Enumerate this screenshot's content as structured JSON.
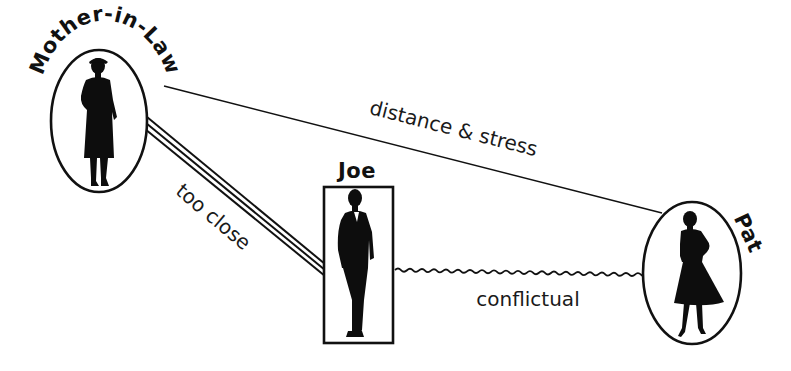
{
  "diagram": {
    "type": "relationship-diagram",
    "colors": {
      "ink": "#111111",
      "background": "#ffffff"
    },
    "nodes": {
      "mother_in_law": {
        "label": "Mother-in-Law",
        "shape": "ellipse",
        "figure": "woman-in-long-coat-silhouette"
      },
      "joe": {
        "label": "Joe",
        "shape": "rectangle",
        "figure": "man-in-suit-silhouette"
      },
      "pat": {
        "label": "Pat",
        "shape": "ellipse",
        "figure": "woman-in-dress-silhouette"
      }
    },
    "edges": {
      "mil_pat": {
        "from": "Mother-in-Law",
        "to": "Pat",
        "style": "single-thin-line",
        "label": "distance & stress"
      },
      "mil_joe": {
        "from": "Mother-in-Law",
        "to": "Joe",
        "style": "triple-line",
        "label": "too close"
      },
      "joe_pat": {
        "from": "Joe",
        "to": "Pat",
        "style": "wavy-line",
        "label": "conflictual"
      }
    }
  }
}
